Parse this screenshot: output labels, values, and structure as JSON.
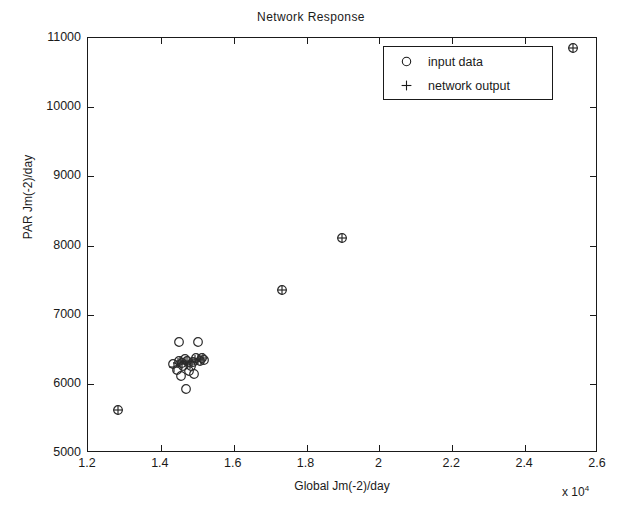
{
  "chart_data": {
    "type": "scatter",
    "title": "Network Response",
    "xlabel": "Global Jm(-2)/day",
    "ylabel": "PAR Jm(-2)/day",
    "x_multiplier": "x 10",
    "x_multiplier_exp": "4",
    "xlim": [
      1.2,
      2.6
    ],
    "ylim": [
      5000,
      11000
    ],
    "xticks": [
      "1.2",
      "1.4",
      "1.6",
      "1.8",
      "2",
      "2.2",
      "2.4",
      "2.6"
    ],
    "xtick_values": [
      1.2,
      1.4,
      1.6,
      1.8,
      2.0,
      2.2,
      2.4,
      2.6
    ],
    "yticks": [
      "5000",
      "6000",
      "7000",
      "8000",
      "9000",
      "10000",
      "11000"
    ],
    "ytick_values": [
      5000,
      6000,
      7000,
      8000,
      9000,
      10000,
      11000
    ],
    "grid": false,
    "legend_position": "top-right",
    "legend": [
      {
        "label": "input data",
        "marker": "circle"
      },
      {
        "label": "network output",
        "marker": "plus"
      }
    ],
    "series": [
      {
        "name": "input data",
        "marker": "circle",
        "x": [
          1.283,
          1.432,
          1.444,
          1.449,
          1.451,
          1.455,
          1.458,
          1.462,
          1.466,
          1.468,
          1.472,
          1.478,
          1.483,
          1.487,
          1.492,
          1.497,
          1.503,
          1.508,
          1.513,
          1.518,
          1.732,
          1.898,
          2.531
        ],
        "y": [
          5620,
          6280,
          6200,
          6610,
          6330,
          6120,
          6300,
          6260,
          6360,
          5930,
          6330,
          6180,
          6260,
          6310,
          6140,
          6380,
          6600,
          6330,
          6370,
          6350,
          7350,
          8110,
          10860
        ]
      },
      {
        "name": "network output",
        "marker": "plus",
        "x": [
          1.283,
          1.437,
          1.446,
          1.452,
          1.459,
          1.465,
          1.471,
          1.479,
          1.486,
          1.494,
          1.501,
          1.509,
          1.516,
          1.732,
          1.898,
          2.531
        ],
        "y": [
          5620,
          6250,
          6300,
          6330,
          6280,
          6310,
          6330,
          6290,
          6320,
          6340,
          6360,
          6350,
          6370,
          7350,
          8110,
          10860
        ]
      }
    ]
  }
}
